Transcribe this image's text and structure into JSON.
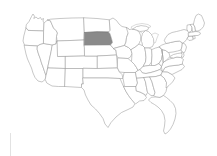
{
  "figure": {
    "title": "United States map with South Dakota highlighted",
    "type": "choropleth-locator-map",
    "width": 217,
    "height": 156,
    "background_color": "#ffffff",
    "outline_color": "#9a9a9a",
    "default_state_fill": "#ffffff",
    "highlight_fill": "#8a8a8a",
    "highlight_stroke": "#6f6f6f",
    "highlighted_states": [
      "South Dakota"
    ],
    "region": "Contiguous United States",
    "caption": ""
  },
  "map_data": {
    "type": "map",
    "projection": "albers-usa-like",
    "units": "state",
    "legend": {
      "visible": false,
      "entries": []
    },
    "labels_visible": false,
    "states": [
      {
        "code": "WA",
        "name": "Washington",
        "highlighted": false
      },
      {
        "code": "OR",
        "name": "Oregon",
        "highlighted": false
      },
      {
        "code": "CA",
        "name": "California",
        "highlighted": false
      },
      {
        "code": "NV",
        "name": "Nevada",
        "highlighted": false
      },
      {
        "code": "ID",
        "name": "Idaho",
        "highlighted": false
      },
      {
        "code": "MT",
        "name": "Montana",
        "highlighted": false
      },
      {
        "code": "WY",
        "name": "Wyoming",
        "highlighted": false
      },
      {
        "code": "UT",
        "name": "Utah",
        "highlighted": false
      },
      {
        "code": "AZ",
        "name": "Arizona",
        "highlighted": false
      },
      {
        "code": "NM",
        "name": "New Mexico",
        "highlighted": false
      },
      {
        "code": "CO",
        "name": "Colorado",
        "highlighted": false
      },
      {
        "code": "ND",
        "name": "North Dakota",
        "highlighted": false
      },
      {
        "code": "SD",
        "name": "South Dakota",
        "highlighted": true
      },
      {
        "code": "NE",
        "name": "Nebraska",
        "highlighted": false
      },
      {
        "code": "KS",
        "name": "Kansas",
        "highlighted": false
      },
      {
        "code": "OK",
        "name": "Oklahoma",
        "highlighted": false
      },
      {
        "code": "TX",
        "name": "Texas",
        "highlighted": false
      },
      {
        "code": "MN",
        "name": "Minnesota",
        "highlighted": false
      },
      {
        "code": "IA",
        "name": "Iowa",
        "highlighted": false
      },
      {
        "code": "MO",
        "name": "Missouri",
        "highlighted": false
      },
      {
        "code": "AR",
        "name": "Arkansas",
        "highlighted": false
      },
      {
        "code": "LA",
        "name": "Louisiana",
        "highlighted": false
      },
      {
        "code": "WI",
        "name": "Wisconsin",
        "highlighted": false
      },
      {
        "code": "IL",
        "name": "Illinois",
        "highlighted": false
      },
      {
        "code": "MS",
        "name": "Mississippi",
        "highlighted": false
      },
      {
        "code": "MI",
        "name": "Michigan",
        "highlighted": false
      },
      {
        "code": "IN",
        "name": "Indiana",
        "highlighted": false
      },
      {
        "code": "OH",
        "name": "Ohio",
        "highlighted": false
      },
      {
        "code": "KY",
        "name": "Kentucky",
        "highlighted": false
      },
      {
        "code": "TN",
        "name": "Tennessee",
        "highlighted": false
      },
      {
        "code": "AL",
        "name": "Alabama",
        "highlighted": false
      },
      {
        "code": "GA",
        "name": "Georgia",
        "highlighted": false
      },
      {
        "code": "FL",
        "name": "Florida",
        "highlighted": false
      },
      {
        "code": "SC",
        "name": "South Carolina",
        "highlighted": false
      },
      {
        "code": "NC",
        "name": "North Carolina",
        "highlighted": false
      },
      {
        "code": "VA",
        "name": "Virginia",
        "highlighted": false
      },
      {
        "code": "WV",
        "name": "West Virginia",
        "highlighted": false
      },
      {
        "code": "MD",
        "name": "Maryland",
        "highlighted": false
      },
      {
        "code": "DE",
        "name": "Delaware",
        "highlighted": false
      },
      {
        "code": "PA",
        "name": "Pennsylvania",
        "highlighted": false
      },
      {
        "code": "NJ",
        "name": "New Jersey",
        "highlighted": false
      },
      {
        "code": "NY",
        "name": "New York",
        "highlighted": false
      },
      {
        "code": "CT",
        "name": "Connecticut",
        "highlighted": false
      },
      {
        "code": "RI",
        "name": "Rhode Island",
        "highlighted": false
      },
      {
        "code": "MA",
        "name": "Massachusetts",
        "highlighted": false
      },
      {
        "code": "VT",
        "name": "Vermont",
        "highlighted": false
      },
      {
        "code": "NH",
        "name": "New Hampshire",
        "highlighted": false
      },
      {
        "code": "ME",
        "name": "Maine",
        "highlighted": false
      }
    ],
    "water_features": [
      {
        "name": "Great Lakes",
        "visible": true
      }
    ]
  }
}
